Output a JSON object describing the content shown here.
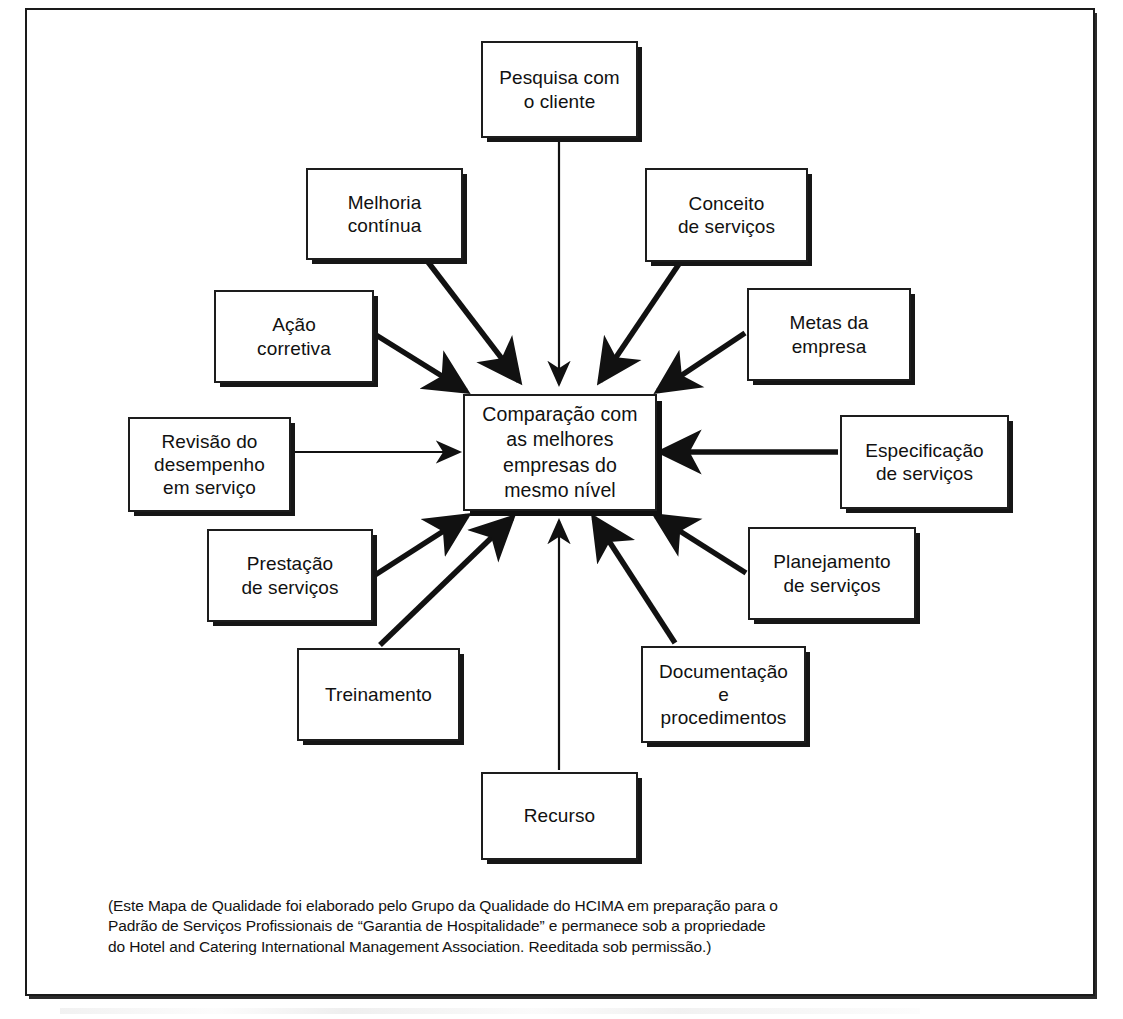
{
  "diagram": {
    "title": "Mapa de Qualidade",
    "center": {
      "id": "comparacao",
      "label": "Comparação com\nas melhores\nempresas do\nmesmo nível",
      "x": 463,
      "y": 394,
      "w": 194,
      "h": 117
    },
    "nodes": [
      {
        "id": "pesquisa-com-o-cliente",
        "label": "Pesquisa com\no cliente",
        "x": 481,
        "y": 41,
        "w": 157,
        "h": 97,
        "arrow": "vertical-down"
      },
      {
        "id": "melhoria-continua",
        "label": "Melhoria\ncontínua",
        "x": 306,
        "y": 168,
        "w": 157,
        "h": 92,
        "arrow": "diagonal-down-right"
      },
      {
        "id": "conceito-de-servicos",
        "label": "Conceito\nde serviços",
        "x": 645,
        "y": 168,
        "w": 163,
        "h": 94,
        "arrow": "diagonal-down-left"
      },
      {
        "id": "acao-corretiva",
        "label": "Ação\ncorretiva",
        "x": 214,
        "y": 290,
        "w": 160,
        "h": 93,
        "arrow": "diagonal-down-right"
      },
      {
        "id": "metas-da-empresa",
        "label": "Metas da\nempresa",
        "x": 747,
        "y": 288,
        "w": 164,
        "h": 93,
        "arrow": "diagonal-down-left"
      },
      {
        "id": "revisao-do-desempenho",
        "label": "Revisão do\ndesempenho\nem serviço",
        "x": 128,
        "y": 417,
        "w": 163,
        "h": 95,
        "arrow": "horizontal-right"
      },
      {
        "id": "especificacao-de-servicos",
        "label": "Especificação\nde serviços",
        "x": 840,
        "y": 415,
        "w": 169,
        "h": 94,
        "arrow": "horizontal-left"
      },
      {
        "id": "prestacao-de-servicos",
        "label": "Prestação\nde serviços",
        "x": 207,
        "y": 529,
        "w": 166,
        "h": 93,
        "arrow": "diagonal-up-right"
      },
      {
        "id": "planejamento-de-servicos",
        "label": "Planejamento\nde serviços",
        "x": 748,
        "y": 527,
        "w": 168,
        "h": 93,
        "arrow": "diagonal-up-left"
      },
      {
        "id": "treinamento",
        "label": "Treinamento",
        "x": 297,
        "y": 648,
        "w": 163,
        "h": 93,
        "arrow": "diagonal-up-right"
      },
      {
        "id": "documentacao-e-procedimentos",
        "label": "Documentação\ne\nprocedimentos",
        "x": 641,
        "y": 646,
        "w": 165,
        "h": 97,
        "arrow": "diagonal-up-left"
      },
      {
        "id": "recurso",
        "label": "Recurso",
        "x": 481,
        "y": 772,
        "w": 157,
        "h": 88,
        "arrow": "vertical-up"
      }
    ],
    "edges": [
      {
        "from": "pesquisa-com-o-cliente",
        "to": "comparacao",
        "style": "thin",
        "path": "M 559,140  L 559,384",
        "head": "down"
      },
      {
        "from": "melhoria-continua",
        "to": "comparacao",
        "style": "thick",
        "path": "M 428,262  L 519,381",
        "head": "down-right"
      },
      {
        "from": "conceito-de-servicos",
        "to": "comparacao",
        "style": "thick",
        "path": "M 679,264  L 600,381",
        "head": "down-left"
      },
      {
        "from": "acao-corretiva",
        "to": "comparacao",
        "style": "thick",
        "path": "M 376,335  L 466,391",
        "head": "down-right"
      },
      {
        "from": "metas-da-empresa",
        "to": "comparacao",
        "style": "thick",
        "path": "M 745,333  L 658,391",
        "head": "down-left"
      },
      {
        "from": "revisao-do-desempenho",
        "to": "comparacao",
        "style": "thin",
        "path": "M 293,452  L 459,452",
        "head": "right"
      },
      {
        "from": "especificacao-de-servicos",
        "to": "comparacao",
        "style": "thick",
        "path": "M 838,452  L 661,452",
        "head": "left"
      },
      {
        "from": "prestacao-de-servicos",
        "to": "comparacao",
        "style": "thick",
        "path": "M 375,575  L 467,516",
        "head": "up-right"
      },
      {
        "from": "planejamento-de-servicos",
        "to": "comparacao",
        "style": "thick",
        "path": "M 746,573  L 656,516",
        "head": "up-left"
      },
      {
        "from": "treinamento",
        "to": "comparacao",
        "style": "thick",
        "path": "M 380,645  L 512,518",
        "head": "up-right"
      },
      {
        "from": "documentacao-e-procedimentos",
        "to": "comparacao",
        "style": "thick",
        "path": "M 675,643  L 594,518",
        "head": "up-left"
      },
      {
        "from": "recurso",
        "to": "comparacao",
        "style": "thin",
        "path": "M 559,770  L 559,521",
        "head": "up"
      }
    ]
  },
  "caption": {
    "lines": [
      "(Este Mapa de Qualidade foi elaborado pelo Grupo da Qualidade do HCIMA em preparação para o",
      "Padrão de Serviços Profissionais de “Garantia de Hospitalidade” e permanece sob a propriedade",
      "do Hotel and Catering International Management Association. Reeditada sob permissão.)"
    ]
  },
  "colors": {
    "ink": "#111111",
    "box_border": "#1d1d1d",
    "shadow": "#161616",
    "page_background": "#ffffff"
  }
}
